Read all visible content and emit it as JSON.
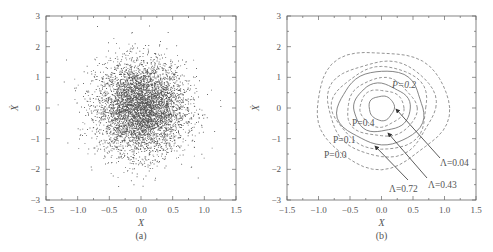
{
  "chart_data": [
    {
      "type": "scatter",
      "panel": "(a)",
      "title": "",
      "xlabel": "X",
      "ylabel": "Ẋ",
      "xlim": [
        -1.5,
        1.5
      ],
      "ylim": [
        -3,
        3
      ],
      "xticks": [
        "−1.5",
        "−1.0",
        "−0.5",
        "0.0",
        "0.5",
        "1.0",
        "1.5"
      ],
      "yticks": [
        "3",
        "2",
        "1",
        "0",
        "−1",
        "−2",
        "−3"
      ],
      "grid": false,
      "description": "Dense cloud of ~thousands of points centered at (0,0), approx. std 0.35 in X and 0.75 in Ẋ; extends roughly X∈[−1.2,1.3], Ẋ∈[−2.5,2.6]",
      "distribution": {
        "center": [
          0,
          0
        ],
        "std_x": 0.35,
        "std_y": 0.75,
        "n_points": 5000
      }
    },
    {
      "type": "line",
      "panel": "(b)",
      "title": "",
      "xlabel": "X",
      "ylabel": "Ẋ",
      "xlim": [
        -1.5,
        1.5
      ],
      "ylim": [
        -3,
        3
      ],
      "xticks": [
        "−1.5",
        "−1.0",
        "−0.5",
        "0.0",
        "0.5",
        "1.0",
        "1.5"
      ],
      "yticks": [
        "3",
        "2",
        "1",
        "0",
        "−1",
        "−2",
        "−3"
      ],
      "grid": false,
      "description": "Probability contour lines (dashed) and solid contour lines around origin",
      "contours": [
        {
          "label": "Λ=0.04",
          "style": "solid",
          "rx": 0.2,
          "ry": 0.4
        },
        {
          "label": "",
          "style": "dashed",
          "rx": 0.35,
          "ry": 0.6
        },
        {
          "label": "Λ=0.43",
          "style": "solid",
          "rx": 0.45,
          "ry": 0.78
        },
        {
          "label": "P=0.4",
          "style": "dashed",
          "rx": 0.55,
          "ry": 0.95
        },
        {
          "label": "Λ=0.72",
          "style": "solid",
          "rx": 0.68,
          "ry": 1.2
        },
        {
          "label": "P=0.2",
          "style": "dashed",
          "rx": 0.75,
          "ry": 1.35
        },
        {
          "label": "P=0.1",
          "style": "dashed",
          "rx": 0.85,
          "ry": 1.55
        },
        {
          "label": "P=0.0",
          "style": "dashed",
          "rx": 1.05,
          "ry": 1.9
        }
      ],
      "annotations": [
        {
          "text": "P=0.2",
          "x": 0.3,
          "y": 0.7
        },
        {
          "text": "P=0.4",
          "x": -0.55,
          "y": -0.45
        },
        {
          "text": "P=0.1",
          "x": -0.85,
          "y": -1.05
        },
        {
          "text": "P=0.0",
          "x": -1.0,
          "y": -1.5
        },
        {
          "text": "Λ=0.04",
          "x": 1.0,
          "y": -1.75,
          "arrow_to": [
            0.2,
            0.0
          ]
        },
        {
          "text": "Λ=0.43",
          "x": 0.8,
          "y": -2.45,
          "arrow_to": [
            0.08,
            -0.75
          ]
        },
        {
          "text": "Λ=0.72",
          "x": 0.05,
          "y": -2.55,
          "arrow_to": [
            -0.1,
            -1.2
          ]
        }
      ]
    }
  ],
  "panels": {
    "a": {
      "label": "(a)",
      "xlabel": "X",
      "ylabel": "Ẋ",
      "xticks": [
        "−1.5",
        "−1.0",
        "−0.5",
        "0.0",
        "0.5",
        "1.0",
        "1.5"
      ],
      "yticks": [
        "3",
        "2",
        "1",
        "0",
        "−1",
        "−2",
        "−3"
      ]
    },
    "b": {
      "label": "(b)",
      "xlabel": "X",
      "ylabel": "Ẋ",
      "xticks": [
        "−1.5",
        "−1.0",
        "−0.5",
        "0.0",
        "0.5",
        "1.0",
        "1.5"
      ],
      "yticks": [
        "3",
        "2",
        "1",
        "0",
        "−1",
        "−2",
        "−3"
      ],
      "annotations": {
        "p02": "P=0.2",
        "p04": "P=0.4",
        "p01": "P=0.1",
        "p00": "P=0.0",
        "l004": "Λ=0.04",
        "l043": "Λ=0.43",
        "l072": "Λ=0.72"
      }
    }
  },
  "colors": {
    "axis": "#666666",
    "points": "#222222",
    "contour_dashed": "#888888",
    "contour_solid": "#777777",
    "arrow": "#333333"
  }
}
